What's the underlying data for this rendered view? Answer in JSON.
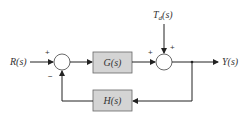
{
  "diagram": {
    "type": "feedback-control-block-diagram",
    "signals": {
      "input": "R(s)",
      "output": "Y(s)",
      "disturbance": "T_d(s)",
      "disturbance_main": "T",
      "disturbance_sub": "d",
      "disturbance_rest": "(s)"
    },
    "blocks": {
      "forward": "G(s)",
      "feedback": "H(s)"
    },
    "summing_junctions": [
      {
        "id": "sum1",
        "signs": {
          "input": "+",
          "feedback": "−"
        }
      },
      {
        "id": "sum2",
        "signs": {
          "forward": "+",
          "disturbance": "+"
        }
      }
    ],
    "colors": {
      "block_fill": "#d4d4d4",
      "line": "#222222",
      "text": "#333333"
    }
  }
}
